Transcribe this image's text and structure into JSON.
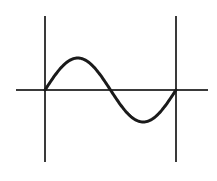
{
  "diagram": {
    "type": "sine-wave-one-period",
    "colors": {
      "line": "#3a3a3a",
      "curve": "#1a1a1a",
      "background": "#ffffff"
    },
    "axis": {
      "y": 90,
      "x_start": 16,
      "x_end": 208
    },
    "left_boundary": {
      "x": 45,
      "y_top": 16,
      "y_bottom": 162
    },
    "right_boundary": {
      "x": 176,
      "y_top": 16,
      "y_bottom": 162
    },
    "wave": {
      "x_start": 45,
      "x_end": 176,
      "baseline": 90,
      "amplitude": 32,
      "periods": 1
    }
  }
}
